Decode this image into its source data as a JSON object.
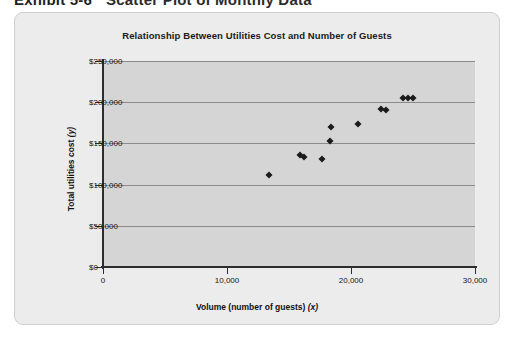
{
  "section_header": {
    "exhibit_label": "Exhibit 5-6",
    "text": "Scatter Plot of Monthly Data"
  },
  "card": {
    "title": "Relationship Between Utilities Cost and Number of Guests"
  },
  "chart_data": {
    "type": "scatter",
    "title": "Relationship Between Utilities Cost and Number of Guests",
    "xlabel": "Volume (number of guests) (x)",
    "ylabel": "Total utilities cost (y)",
    "xlabel_main": "Volume (number of guests)",
    "xlabel_var": "(x)",
    "ylabel_main": "Total utilities cost",
    "ylabel_var": "(y)",
    "xlim": [
      0,
      30000
    ],
    "ylim": [
      0,
      250000
    ],
    "xticks": [
      0,
      10000,
      20000,
      30000
    ],
    "xtick_labels": [
      "0",
      "10,000",
      "20,000",
      "30,000"
    ],
    "yticks": [
      0,
      50000,
      100000,
      150000,
      200000,
      250000
    ],
    "ytick_labels": [
      "$0",
      "$50,000",
      "$100,000",
      "$150,000",
      "$200,000",
      "$250,000"
    ],
    "grid": true,
    "grid_axis": "y",
    "legend": false,
    "marker": "diamond",
    "marker_color": "#1b1b1b",
    "plot_bg_color": "#d5d5d5",
    "card_bg_color": "#ececec",
    "points": [
      {
        "x": 13400,
        "y": 112000
      },
      {
        "x": 15900,
        "y": 136000
      },
      {
        "x": 16200,
        "y": 133000
      },
      {
        "x": 17700,
        "y": 131000
      },
      {
        "x": 18300,
        "y": 153000
      },
      {
        "x": 18400,
        "y": 170000
      },
      {
        "x": 20600,
        "y": 173000
      },
      {
        "x": 22400,
        "y": 192000
      },
      {
        "x": 22800,
        "y": 191000
      },
      {
        "x": 24200,
        "y": 205000
      },
      {
        "x": 24600,
        "y": 205000
      },
      {
        "x": 25000,
        "y": 205000
      }
    ]
  }
}
